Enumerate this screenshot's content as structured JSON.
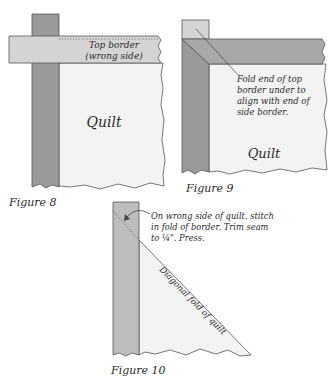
{
  "colors": {
    "background": "#ffffff",
    "quilt_fill": "#f3f3f3",
    "border_dark": "#9a9a9a",
    "border_medium": "#bdbdbd",
    "border_light": "#d4d4d4",
    "outline": "#555555",
    "text": "#2a2a2a"
  },
  "figure8": {
    "caption": "Figure 8",
    "top_border_label_line1": "Top border",
    "top_border_label_line2": "(wrong side)",
    "quilt_label": "Quilt"
  },
  "figure9": {
    "caption": "Figure 9",
    "note_line1": "Fold end of top",
    "note_line2": "border under to",
    "note_line3": "align with end of",
    "note_line4": "side border.",
    "quilt_label": "Quilt"
  },
  "figure10": {
    "caption": "Figure 10",
    "note_line1": "On wrong side of quilt, stitch",
    "note_line2": "in fold of border. Trim seam",
    "note_line3": "to ¼\". Press.",
    "diagonal_label": "Diagonal fold of quilt"
  }
}
